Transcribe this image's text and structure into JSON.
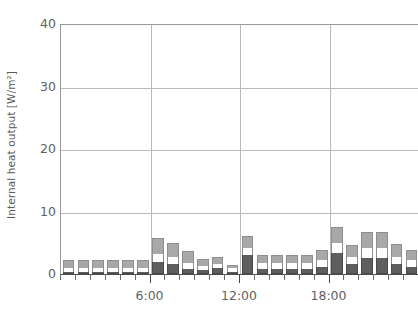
{
  "chart_data": {
    "type": "bar",
    "stacked": true,
    "title": "",
    "xlabel": "",
    "ylabel": "Internal heat output [W/m²]",
    "ylim": [
      0,
      40
    ],
    "yticks": [
      0,
      10,
      20,
      30,
      40
    ],
    "ytick_labels": [
      "0",
      "10",
      "20",
      "30",
      "40"
    ],
    "grid": "horizontal-and-vertical",
    "legend": "none",
    "x": [
      "0:00",
      "1:00",
      "2:00",
      "3:00",
      "4:00",
      "5:00",
      "6:00",
      "7:00",
      "8:00",
      "9:00",
      "10:00",
      "11:00",
      "12:00",
      "13:00",
      "14:00",
      "15:00",
      "16:00",
      "17:00",
      "18:00",
      "19:00",
      "20:00",
      "21:00",
      "22:00",
      "23:00"
    ],
    "xtick_labels": [
      "6:00",
      "12:00",
      "18:00"
    ],
    "xtick_label_values": [
      "6:00",
      "12:00",
      "18:00"
    ],
    "categories": [
      "0:00",
      "1:00",
      "2:00",
      "3:00",
      "4:00",
      "5:00",
      "6:00",
      "7:00",
      "8:00",
      "9:00",
      "10:00",
      "11:00",
      "12:00",
      "13:00",
      "14:00",
      "15:00",
      "16:00",
      "17:00",
      "18:00",
      "19:00",
      "20:00",
      "21:00",
      "22:00",
      "23:00"
    ],
    "series": [
      {
        "name": "lower-segment",
        "color": "#5e5e5e",
        "values": [
          0.3,
          0.3,
          0.3,
          0.3,
          0.3,
          0.3,
          2.0,
          1.6,
          0.8,
          0.6,
          0.9,
          0.4,
          3.0,
          0.8,
          0.8,
          0.8,
          0.8,
          1.1,
          3.3,
          1.6,
          2.6,
          2.6,
          1.6,
          1.2
        ]
      },
      {
        "name": "middle-segment",
        "color": "#ffffff",
        "values": [
          0.6,
          0.6,
          0.6,
          0.6,
          0.6,
          0.6,
          1.2,
          1.2,
          1.0,
          0.7,
          0.7,
          0.5,
          1.2,
          0.9,
          0.9,
          0.9,
          0.9,
          1.2,
          1.6,
          1.2,
          1.5,
          1.5,
          1.2,
          1.0
        ]
      },
      {
        "name": "upper-segment",
        "color": "#a8a8a8",
        "values": [
          1.3,
          1.3,
          1.3,
          1.3,
          1.3,
          1.3,
          2.6,
          2.2,
          1.9,
          1.1,
          1.1,
          0.6,
          1.9,
          1.3,
          1.3,
          1.3,
          1.3,
          1.6,
          2.7,
          1.9,
          2.6,
          2.6,
          2.0,
          1.6
        ]
      }
    ],
    "totals": [
      2.2,
      2.2,
      2.2,
      2.2,
      2.2,
      2.2,
      5.8,
      5.0,
      3.7,
      2.4,
      2.7,
      1.5,
      6.1,
      3.0,
      3.0,
      3.0,
      3.0,
      3.9,
      7.6,
      4.7,
      6.7,
      6.7,
      4.8,
      3.8
    ],
    "axis_colors": {
      "axis_line": "#4a4a4a",
      "grid_line": "#b9b9b9",
      "tick_text": "#5f5f5f",
      "label_text": "#5a5a5a"
    }
  }
}
